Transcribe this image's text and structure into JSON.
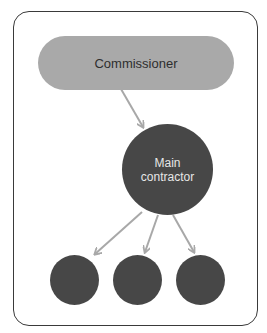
{
  "diagram": {
    "top_node": {
      "label": "Commissioner",
      "color": "#a9a9a9"
    },
    "middle_node": {
      "label": "Main contractor",
      "color": "#474747"
    },
    "bottom_nodes": [
      {
        "label": "",
        "color": "#474747"
      },
      {
        "label": "",
        "color": "#474747"
      },
      {
        "label": "",
        "color": "#474747"
      }
    ],
    "edges": [
      {
        "from": "Commissioner",
        "to": "Main contractor"
      },
      {
        "from": "Main contractor",
        "to": "bottom-node-1"
      },
      {
        "from": "Main contractor",
        "to": "bottom-node-2"
      },
      {
        "from": "Main contractor",
        "to": "bottom-node-3"
      }
    ],
    "arrow_color": "#a8a8a8",
    "frame_color": "#3a3a3a"
  }
}
